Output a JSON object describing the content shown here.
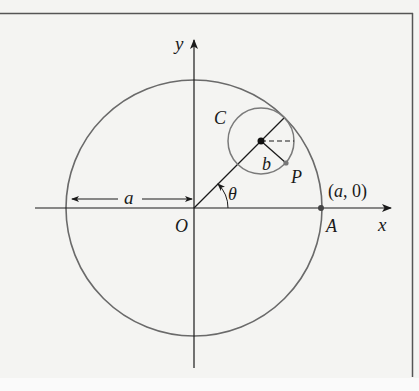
{
  "diagram": {
    "type": "hypocycloid-construction",
    "colors": {
      "background": "#f4f4f2",
      "frame": "#555555",
      "axis": "#1a1a1a",
      "big_circle": "#6a6a6a",
      "small_circle": "#7a7a7a",
      "text": "#1a1a1a"
    },
    "labels": {
      "y_axis": "y",
      "x_axis": "x",
      "origin": "O",
      "radius_big": "a",
      "angle": "θ",
      "small_circle": "C",
      "radius_small": "b",
      "point_p": "P",
      "point_a": "A",
      "point_a_coords": "(a, 0)"
    },
    "geometry": {
      "origin": [
        194,
        208
      ],
      "big_radius": 128,
      "small_center": [
        261,
        141
      ],
      "small_radius": 33,
      "angle_deg": 45,
      "point_p": [
        286,
        162
      ],
      "point_a": [
        321,
        208
      ]
    }
  }
}
